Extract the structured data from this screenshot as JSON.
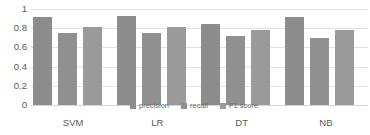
{
  "chart_data": {
    "type": "bar",
    "title": "",
    "subtitle": "",
    "xlabel": "",
    "ylabel": "",
    "categories": [
      "SVM",
      "LR",
      "DT",
      "NB"
    ],
    "series": [
      {
        "name": "precision",
        "values": [
          0.92,
          0.93,
          0.84,
          0.92
        ],
        "color": "#8c8c8c"
      },
      {
        "name": "recall",
        "values": [
          0.755,
          0.745,
          0.715,
          0.7
        ],
        "color": "#909090"
      },
      {
        "name": "F1 score",
        "values": [
          0.81,
          0.815,
          0.785,
          0.785
        ],
        "color": "#9a9a9a"
      }
    ],
    "ylim": [
      0,
      1
    ],
    "y_ticks": [
      0,
      0.2,
      0.4,
      0.6,
      0.8,
      1
    ],
    "y_tick_labels": [
      "0",
      "0.2",
      "0.4",
      "0.6",
      "0.8",
      "1"
    ],
    "grid": true,
    "grid_axis": "y",
    "legend": true,
    "legend_position": "center",
    "legend_entries": [
      "precision",
      "recall",
      "F1 score"
    ],
    "background_color": "#ffffff",
    "gridline_color": "#e2e2e2",
    "tick_label_color": "#5a5a5a"
  }
}
